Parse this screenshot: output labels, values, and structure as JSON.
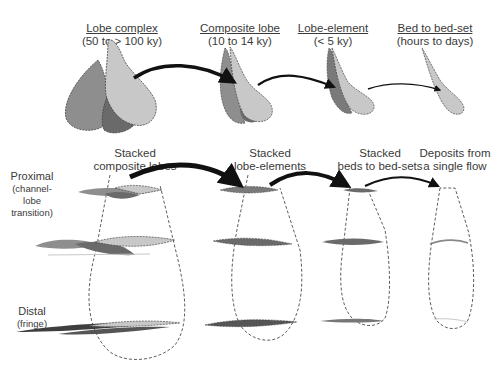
{
  "top_row": {
    "stages": [
      {
        "title": "Lobe complex",
        "duration": "(50 to > 100 ky)"
      },
      {
        "title": "Composite lobe",
        "duration": "(10 to 14 ky)"
      },
      {
        "title": "Lobe-element",
        "duration": "(< 5 ky)"
      },
      {
        "title": "Bed to bed-set",
        "duration": "(hours to days)"
      }
    ]
  },
  "bottom_row": {
    "columns": [
      {
        "line1": "Stacked",
        "line2": "composite lobes"
      },
      {
        "line1": "Stacked",
        "line2": "lobe-elements"
      },
      {
        "line1": "Stacked",
        "line2": "beds to bed-sets"
      },
      {
        "line1": "Deposits from",
        "line2": "a single flow"
      }
    ],
    "side_labels": {
      "proximal": {
        "main": "Proximal",
        "sub1": "(channel-",
        "sub2": "lobe",
        "sub3": "transition)"
      },
      "distal": {
        "main": "Distal",
        "sub1": "(fringe)"
      }
    }
  },
  "colors": {
    "light_fill": "#c8c8c8",
    "mid_fill": "#8e8e8e",
    "dark_fill": "#6a6a6a",
    "arrow": "#111111",
    "outline": "#333333"
  }
}
